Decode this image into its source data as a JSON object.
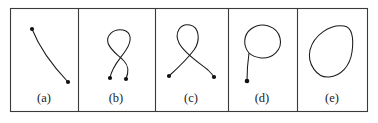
{
  "figure": {
    "background_color": "#ffffff",
    "stroke_color": "#1a1a1a",
    "frame_color": "#3a3a3a",
    "dot_color": "#111111",
    "frame": {
      "x": 10,
      "y": 8,
      "width": 358,
      "height": 104
    },
    "divider_x": [
      78,
      155,
      228,
      297
    ],
    "caption_baseline_y": 102
  },
  "panels": [
    {
      "id": "panel-a",
      "caption": "(a)",
      "caption_x": 44,
      "description": "simple open arc with two endpoints",
      "endpoints": [
        {
          "x": 32,
          "y": 29
        },
        {
          "x": 68,
          "y": 82
        }
      ],
      "dot_radius": 2.1,
      "path": "M 32 29 C 38 44, 49 62, 68 82"
    },
    {
      "id": "panel-b",
      "caption": "(b)",
      "caption_x": 116,
      "description": "double loop weave with two crossings and two endpoints",
      "endpoints": [
        {
          "x": 110,
          "y": 78
        },
        {
          "x": 126,
          "y": 79
        }
      ],
      "dot_radius": 2.1,
      "path": "M 110 78 C 112 66, 121 58, 126 50 C 132 41, 132 32, 123 30 C 113 28, 106 36, 108 43 C 110 50, 118 55, 124 61 C 130 67, 128 74, 126 79"
    },
    {
      "id": "panel-c",
      "caption": "(c)",
      "caption_x": 191,
      "description": "single teardrop loop with one crossing and two splayed endpoints",
      "endpoints": [
        {
          "x": 169,
          "y": 76
        },
        {
          "x": 214,
          "y": 77
        }
      ],
      "dot_radius": 2.1,
      "path": "M 169 76 C 180 66, 188 58, 194 50 C 201 40, 199 27, 190 25 C 180 23, 174 33, 179 43 C 184 53, 198 62, 208 70 C 211 73, 213 75, 214 77"
    },
    {
      "id": "panel-d",
      "caption": "(d)",
      "caption_x": 262,
      "description": "closed balloon loop with a descending tail to one endpoint",
      "endpoints": [
        {
          "x": 247,
          "y": 81
        }
      ],
      "dot_radius": 2.3,
      "path": "M 247 81 C 247 70, 248 60, 249 53 C 243 46, 243 35, 251 29 C 262 21, 277 26, 280 38 C 283 50, 272 59, 261 58 C 255 57, 251 55, 249 53"
    },
    {
      "id": "panel-e",
      "caption": "(e)",
      "caption_x": 332,
      "description": "closed rounded-triangle curve, no endpoints",
      "endpoints": [],
      "dot_radius": 0,
      "path": "M 310 50 C 314 35, 330 24, 344 26 C 352 27, 354 38, 352 52 C 350 66, 341 76, 329 77 C 317 78, 307 64, 310 50 Z"
    }
  ]
}
